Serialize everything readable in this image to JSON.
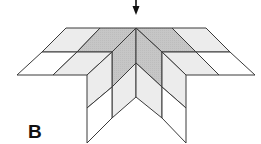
{
  "figure": {
    "label": "B",
    "colors": {
      "stroke": "#3a3a3a",
      "dark": "#c6c6c6",
      "light": "#ececec",
      "white": "#ffffff",
      "arrow": "#111111"
    },
    "arrow": {
      "x": 136,
      "y_start": 0,
      "y_end": 15
    },
    "apex": {
      "x": 136,
      "y": 28
    },
    "cells": [
      {
        "id": "top-row-1",
        "fill": "light",
        "points": "66,28 100,28 77,52 42,52"
      },
      {
        "id": "top-row-2",
        "fill": "dark",
        "points": "100,28 136,28 112,52 77,52"
      },
      {
        "id": "top-row-3",
        "fill": "dark",
        "points": "136,28 172,28 196,52 162,52"
      },
      {
        "id": "top-row-4",
        "fill": "light",
        "points": "172,28 206,28 230,52 196,52"
      },
      {
        "id": "bottom-row-1",
        "fill": "white",
        "points": "42,52 77,52 53,75 17,75"
      },
      {
        "id": "bottom-row-2",
        "fill": "light",
        "points": "77,52 112,52 87,75 53,75"
      },
      {
        "id": "bottom-row-3",
        "fill": "light",
        "points": "162,52 196,52 219,75 186,75"
      },
      {
        "id": "bottom-row-4",
        "fill": "white",
        "points": "196,52 230,52 255,75 219,75"
      },
      {
        "id": "left-inner-upper",
        "fill": "dark",
        "points": "112,52 136,28 136,63 112,87"
      },
      {
        "id": "left-inner-lower",
        "fill": "light",
        "points": "112,87 136,63 136,97 112,118"
      },
      {
        "id": "right-inner-upper",
        "fill": "dark",
        "points": "136,28 162,52 162,87 136,63"
      },
      {
        "id": "right-inner-lower",
        "fill": "light",
        "points": "136,63 162,87 162,118 136,97"
      },
      {
        "id": "left-outer-upper",
        "fill": "light",
        "points": "87,75 112,52 112,87 87,108"
      },
      {
        "id": "left-outer-lower",
        "fill": "white",
        "points": "87,108 112,87 112,118 87,143"
      },
      {
        "id": "right-outer-upper",
        "fill": "light",
        "points": "162,52 186,75 186,108 162,87"
      },
      {
        "id": "right-outer-lower",
        "fill": "white",
        "points": "162,87 186,108 186,143 162,118"
      }
    ]
  }
}
